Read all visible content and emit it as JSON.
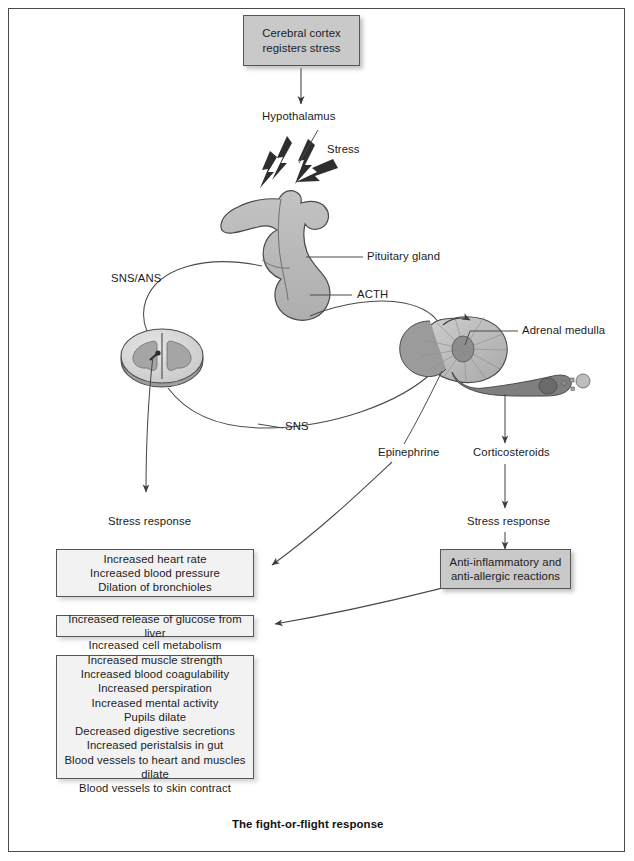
{
  "figure": {
    "caption": "The fight-or-flight response",
    "colors": {
      "box_gray_fill": "#c9c9c9",
      "box_light_fill": "#f2f2f2",
      "box_border": "#555555",
      "frame_border": "#4a4a4a",
      "anatomy_mid_gray": "#b3b3b3",
      "anatomy_dark_gray": "#8a8a8a",
      "anatomy_light_gray": "#dcdcdc",
      "arrow_stroke": "#4a4a4a",
      "text": "#1b1b1b"
    }
  },
  "boxes": {
    "cerebral_cortex": {
      "lines": [
        "Cerebral cortex",
        "registers stress"
      ]
    },
    "epinephrine_effects": {
      "lines": [
        "Increased heart rate",
        "Increased blood pressure",
        "Dilation of bronchioles"
      ]
    },
    "glucose_release": {
      "lines": [
        "Increased release of glucose from liver"
      ]
    },
    "sns_effects": {
      "lines": [
        "Increased cell metabolism",
        "Increased muscle strength",
        "Increased blood coagulability",
        "Increased perspiration",
        "Increased mental activity",
        "Pupils dilate",
        "Decreased digestive secretions",
        "Increased peristalsis in gut",
        "Blood vessels to heart and muscles dilate",
        "Blood vessels to skin contract"
      ]
    },
    "corticosteroid_effects": {
      "lines": [
        "Anti-inflammatory and",
        "anti-allergic reactions"
      ]
    }
  },
  "labels": {
    "hypothalamus": "Hypothalamus",
    "stress": "Stress",
    "pituitary_gland": "Pituitary gland",
    "sns_ans": "SNS/ANS",
    "acth": "ACTH",
    "sns": "SNS",
    "adrenal_medulla": "Adrenal medulla",
    "epinephrine": "Epinephrine",
    "corticosteroids": "Corticosteroids",
    "stress_response_left": "Stress response",
    "stress_response_right": "Stress response"
  },
  "icons": {
    "lightning": "lightning-bolt-icon",
    "pituitary": "pituitary-gland-icon",
    "spinal_cord": "spinal-cord-cross-section-icon",
    "adrenal": "adrenal-gland-icon",
    "hormone_particles": "hormone-particle-icon"
  }
}
